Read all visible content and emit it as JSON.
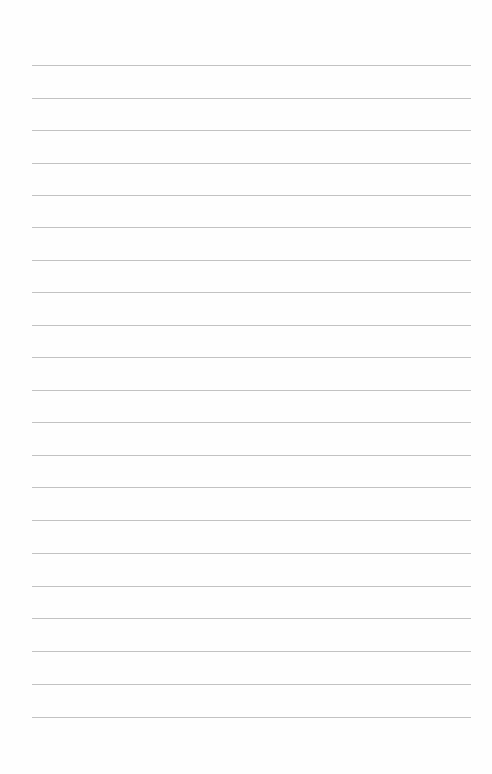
{
  "page": {
    "type": "ruled-notebook-page",
    "background_color": "#fefefe",
    "rule_color": "#c2c2c2",
    "rule_left": 32,
    "rule_width": 439,
    "rules": [
      65,
      98,
      130,
      163,
      195,
      227,
      260,
      292,
      325,
      357,
      390,
      422,
      455,
      487,
      520,
      553,
      586,
      618,
      651,
      684,
      717
    ]
  }
}
